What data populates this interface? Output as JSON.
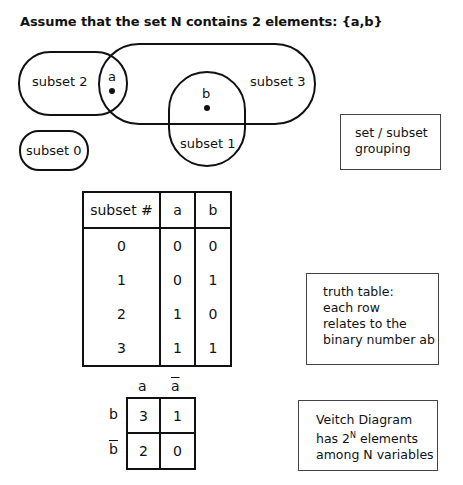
{
  "title": "Assume that the set N contains 2 elements: {a,b}",
  "venn": {
    "subsets": [
      {
        "id": "subset0",
        "label": "subset 0"
      },
      {
        "id": "subset1",
        "label": "subset 1"
      },
      {
        "id": "subset2",
        "label": "subset 2"
      },
      {
        "id": "subset3",
        "label": "subset 3"
      }
    ],
    "elements": [
      {
        "id": "a",
        "label": "a"
      },
      {
        "id": "b",
        "label": "b"
      }
    ]
  },
  "notes": {
    "grouping": [
      "set / subset",
      "grouping"
    ],
    "truth_table": [
      "truth table:",
      "each row",
      "relates to the",
      "binary number ab"
    ],
    "veitch": {
      "line1": "Veitch Diagram",
      "line2_prefix": "has 2",
      "line2_sup": "N",
      "line2_suffix": " elements",
      "line3": "among N variables"
    }
  },
  "truth_table": {
    "headers": [
      "subset #",
      "a",
      "b"
    ],
    "rows": [
      [
        "0",
        "0",
        "0"
      ],
      [
        "1",
        "0",
        "1"
      ],
      [
        "2",
        "1",
        "0"
      ],
      [
        "3",
        "1",
        "1"
      ]
    ]
  },
  "veitch": {
    "col_labels": [
      "a",
      "a"
    ],
    "col_negated": [
      false,
      true
    ],
    "row_labels": [
      "b",
      "b"
    ],
    "row_negated": [
      false,
      true
    ],
    "cells": [
      [
        "3",
        "1"
      ],
      [
        "2",
        "0"
      ]
    ]
  }
}
